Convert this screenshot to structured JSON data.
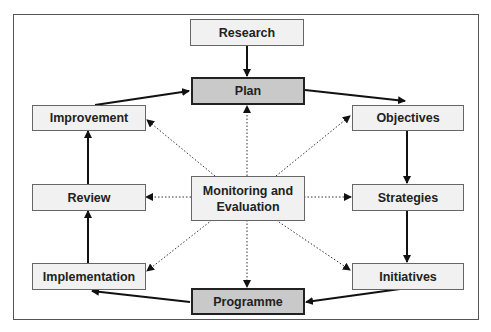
{
  "diagram": {
    "nodes": {
      "research": "Research",
      "plan": "Plan",
      "improvement": "Improvement",
      "objectives": "Objectives",
      "review": "Review",
      "monitoring": "Monitoring and Evaluation",
      "strategies": "Strategies",
      "implementation": "Implementation",
      "initiatives": "Initiatives",
      "programme": "Programme"
    },
    "edges_solid": [
      [
        "Research",
        "Plan"
      ],
      [
        "Plan",
        "Objectives"
      ],
      [
        "Objectives",
        "Strategies"
      ],
      [
        "Strategies",
        "Initiatives"
      ],
      [
        "Initiatives",
        "Programme"
      ],
      [
        "Programme",
        "Implementation"
      ],
      [
        "Implementation",
        "Review"
      ],
      [
        "Review",
        "Improvement"
      ],
      [
        "Improvement",
        "Plan"
      ]
    ],
    "edges_dotted_from_monitoring": [
      "Plan",
      "Objectives",
      "Strategies",
      "Initiatives",
      "Programme",
      "Implementation",
      "Review",
      "Improvement"
    ],
    "colors": {
      "highlight_fill": "#c9c9c9",
      "box_fill": "#f1f1f1",
      "border": "#222222"
    }
  }
}
